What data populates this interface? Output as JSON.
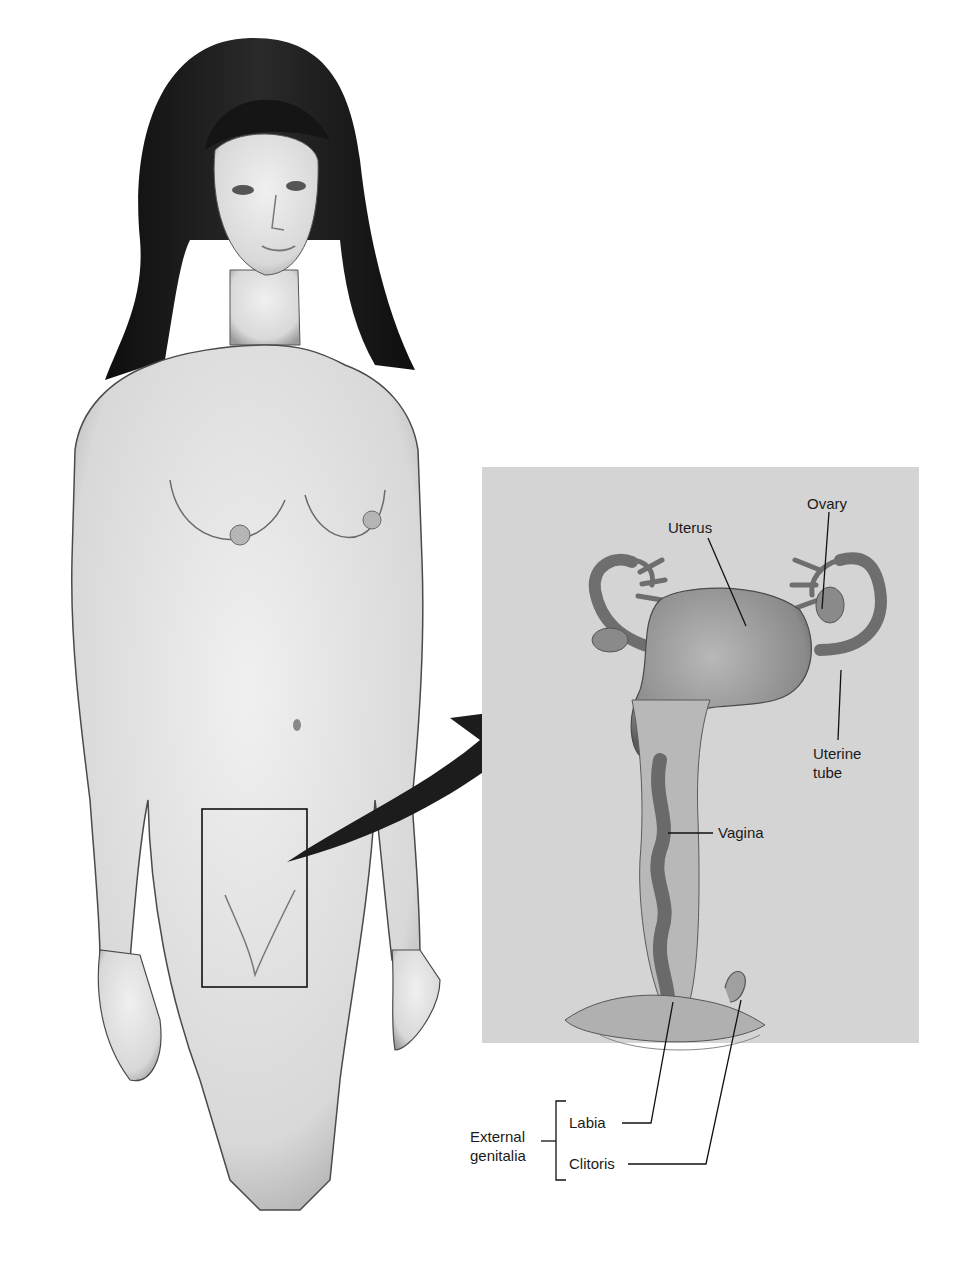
{
  "figure": {
    "inset_labels": {
      "uterus": "Uterus",
      "ovary": "Ovary",
      "uterine_tube_line1": "Uterine",
      "uterine_tube_line2": "tube",
      "vagina": "Vagina"
    },
    "external_group": {
      "title_line1": "External",
      "title_line2": "genitalia",
      "items": [
        "Labia",
        "Clitoris"
      ]
    },
    "colors": {
      "inset_background": "#d4d4d4",
      "skin": "#e6e6e6",
      "hair": "#151515",
      "outline": "#222222",
      "organ": "#8a8a8a"
    }
  }
}
